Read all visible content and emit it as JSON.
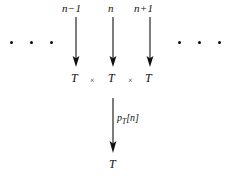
{
  "figure": {
    "background": "#ffffff",
    "ink_color": "#111111",
    "width": 226,
    "height": 176
  },
  "top_labels": [
    {
      "text": "n−1",
      "x": 75
    },
    {
      "text": "n",
      "x": 112
    },
    {
      "text": "n+1",
      "x": 149
    }
  ],
  "top_arrows": [
    {
      "name": "arrow-n-minus-1",
      "x": 75,
      "y_top": 17,
      "y_bottom": 66
    },
    {
      "name": "arrow-n",
      "x": 112,
      "y_top": 17,
      "y_bottom": 66
    },
    {
      "name": "arrow-n-plus-1",
      "x": 149,
      "y_top": 17,
      "y_bottom": 66
    }
  ],
  "factor_row": {
    "terms": [
      {
        "text": "T",
        "x": 75
      },
      {
        "text": "T",
        "x": 112
      },
      {
        "text": "T",
        "x": 149
      }
    ],
    "operators": [
      {
        "text": "×",
        "x": 93
      },
      {
        "text": "×",
        "x": 131
      }
    ]
  },
  "ellipsis": {
    "left": {
      "name": "ellipsis-left",
      "x": 10,
      "y": 42,
      "dots": 3
    },
    "right": {
      "name": "ellipsis-right",
      "x": 178,
      "y": 42,
      "dots": 3
    }
  },
  "map_arrow": {
    "name": "arrow-p-T-n",
    "x": 113,
    "y_top": 98,
    "y_bottom": 152,
    "label": {
      "base": "p",
      "subscript": "T",
      "bracket_open": "[",
      "argument": "n",
      "bracket_close": "]",
      "x": 118,
      "y": 118
    }
  },
  "result": {
    "text": "T",
    "x": 113,
    "y": 160
  }
}
